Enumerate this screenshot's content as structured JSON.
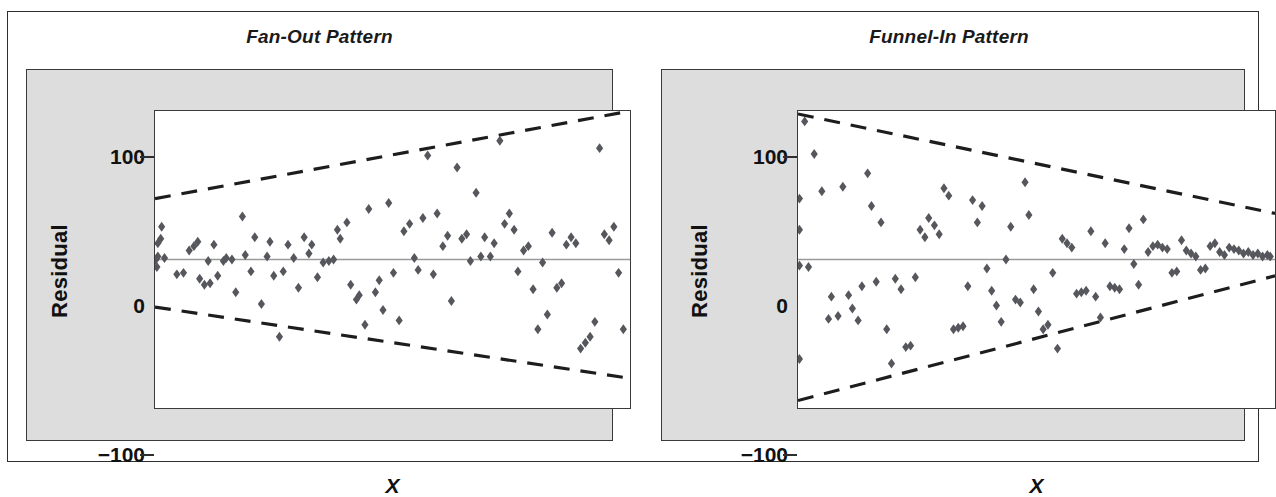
{
  "figure": {
    "panels": [
      {
        "id": "fan-out",
        "title": "Fan-Out Pattern",
        "xlabel": "X",
        "ylabel": "Residual",
        "yticks": [
          "100",
          "0",
          "−100"
        ]
      },
      {
        "id": "funnel-in",
        "title": "Funnel-In Pattern",
        "xlabel": "X",
        "ylabel": "Residual",
        "yticks": [
          "100",
          "0",
          "−100"
        ]
      }
    ]
  },
  "colors": {
    "marker": "#55575c",
    "panel_background": "#dddddd",
    "plot_background": "#ffffff",
    "border": "#3a3a3a",
    "zero_line": "#9a9a9a",
    "bound_line": "#1d1d1d"
  },
  "chart_data": [
    {
      "type": "scatter",
      "title": "Fan-Out Pattern",
      "xlabel": "X",
      "ylabel": "Residual",
      "xlim": [
        0,
        100
      ],
      "ylim": [
        -100,
        100
      ],
      "yticks": [
        -100,
        0,
        100
      ],
      "grid": false,
      "legend": null,
      "annotations": [
        {
          "name": "upper-boundary",
          "style": "dashed",
          "x": [
            0,
            100
          ],
          "y": [
            41,
            100
          ]
        },
        {
          "name": "lower-boundary",
          "style": "dashed",
          "x": [
            0,
            100
          ],
          "y": [
            -32,
            -80
          ]
        },
        {
          "name": "zero-reference",
          "style": "solid",
          "x": [
            0,
            100
          ],
          "y": [
            0,
            0
          ]
        }
      ],
      "x": [
        0.2,
        0.4,
        0.6,
        0.6,
        1.2,
        1.4,
        2.0,
        4.6,
        6.0,
        7.2,
        8.2,
        9.0,
        9.4,
        10.4,
        11.2,
        11.6,
        12.4,
        13.2,
        14.4,
        15.0,
        16.2,
        17.0,
        18.4,
        19.0,
        20.2,
        21.0,
        22.4,
        23.6,
        24.2,
        25.0,
        26.2,
        27.0,
        28.0,
        29.2,
        30.2,
        31.4,
        32.4,
        33.0,
        34.2,
        35.4,
        36.6,
        37.6,
        38.4,
        39.0,
        40.4,
        41.2,
        42.4,
        43.0,
        44.2,
        45.0,
        46.4,
        47.2,
        48.0,
        49.2,
        50.2,
        51.4,
        52.4,
        53.6,
        54.6,
        55.4,
        56.4,
        57.4,
        58.6,
        59.4,
        60.6,
        61.6,
        62.4,
        63.6,
        64.6,
        65.6,
        66.4,
        67.6,
        68.6,
        69.4,
        70.6,
        71.4,
        72.6,
        73.6,
        74.6,
        75.6,
        76.4,
        77.6,
        78.6,
        79.6,
        80.6,
        81.6,
        82.6,
        83.6,
        84.6,
        85.6,
        86.6,
        87.6,
        88.6,
        89.6,
        90.6,
        91.6,
        92.6,
        93.6,
        94.6,
        95.6,
        96.6,
        97.6,
        98.6
      ],
      "y": [
        0,
        -5,
        2,
        11,
        14,
        22,
        1,
        -10,
        -9,
        6,
        9,
        12,
        -13,
        -17,
        -1,
        -16,
        10,
        -11,
        -1,
        1,
        0,
        -22,
        29,
        3,
        -8,
        15,
        -30,
        2,
        12,
        -11,
        -52,
        -8,
        10,
        1,
        -19,
        15,
        4,
        10,
        -12,
        -2,
        -1,
        0,
        20,
        14,
        25,
        -17,
        -27,
        -24,
        -44,
        34,
        -22,
        -14,
        -34,
        38,
        -9,
        -41,
        19,
        24,
        1,
        -7,
        28,
        70,
        -10,
        31,
        9,
        16,
        -28,
        62,
        14,
        17,
        -1,
        45,
        2,
        15,
        2,
        11,
        80,
        24,
        31,
        20,
        -8,
        6,
        9,
        -20,
        -47,
        -2,
        -37,
        18,
        -19,
        -16,
        10,
        15,
        11,
        -60,
        -56,
        -52,
        -42,
        75,
        17,
        13,
        22,
        -9,
        -47
      ]
    },
    {
      "type": "scatter",
      "title": "Funnel-In Pattern",
      "xlabel": "X",
      "ylabel": "Residual",
      "xlim": [
        0,
        100
      ],
      "ylim": [
        -100,
        100
      ],
      "yticks": [
        -100,
        0,
        100
      ],
      "grid": false,
      "legend": null,
      "annotations": [
        {
          "name": "upper-boundary",
          "style": "dashed",
          "x": [
            0,
            100
          ],
          "y": [
            98,
            31
          ]
        },
        {
          "name": "lower-boundary",
          "style": "dashed",
          "x": [
            0,
            100
          ],
          "y": [
            -95,
            -11
          ]
        },
        {
          "name": "zero-reference",
          "style": "solid",
          "x": [
            0,
            100
          ],
          "y": [
            0,
            0
          ]
        }
      ],
      "x": [
        0.3,
        0.3,
        0.3,
        0.3,
        1.4,
        2.2,
        3.4,
        5.0,
        6.4,
        7.0,
        8.4,
        9.4,
        10.6,
        11.4,
        12.6,
        13.4,
        14.6,
        15.4,
        16.4,
        17.4,
        18.6,
        19.6,
        20.4,
        21.6,
        22.6,
        23.6,
        24.6,
        25.6,
        26.6,
        27.4,
        28.6,
        29.6,
        30.6,
        31.6,
        32.6,
        33.6,
        34.6,
        35.6,
        36.6,
        37.6,
        38.6,
        39.6,
        40.6,
        41.6,
        42.6,
        43.6,
        44.6,
        45.6,
        46.6,
        47.6,
        48.4,
        49.4,
        50.4,
        51.4,
        52.4,
        53.4,
        54.4,
        55.4,
        56.4,
        57.4,
        58.4,
        59.4,
        60.4,
        61.4,
        62.4,
        63.4,
        64.4,
        65.4,
        66.4,
        67.4,
        68.4,
        69.4,
        70.4,
        71.4,
        72.4,
        73.4,
        74.4,
        75.4,
        76.4,
        77.4,
        78.4,
        79.4,
        80.4,
        81.4,
        82.4,
        83.4,
        84.4,
        85.4,
        86.4,
        87.4,
        88.4,
        89.4,
        90.4,
        91.4,
        92.4,
        93.4,
        94.4,
        95.4,
        96.4,
        97.4,
        98.4,
        99.0
      ],
      "y": [
        41,
        20,
        -4,
        -67,
        93,
        -5,
        71,
        46,
        -40,
        -25,
        -38,
        49,
        -24,
        -33,
        -41,
        -18,
        58,
        36,
        -15,
        25,
        -47,
        -70,
        -13,
        -20,
        -59,
        -58,
        -12,
        20,
        15,
        28,
        23,
        17,
        48,
        43,
        -47,
        -46,
        -45,
        -18,
        40,
        25,
        36,
        -6,
        -21,
        -31,
        -42,
        0,
        22,
        -27,
        -29,
        52,
        30,
        -20,
        -35,
        -47,
        -44,
        -9,
        -60,
        14,
        11,
        8,
        -23,
        -22,
        -21,
        19,
        -25,
        -39,
        11,
        -18,
        -19,
        -20,
        7,
        21,
        -3,
        -17,
        27,
        5,
        9,
        10,
        8,
        7,
        -9,
        -8,
        13,
        6,
        4,
        2,
        -7,
        -6,
        9,
        11,
        5,
        3,
        8,
        7,
        6,
        4,
        5,
        3,
        4,
        2,
        3,
        2
      ]
    }
  ]
}
